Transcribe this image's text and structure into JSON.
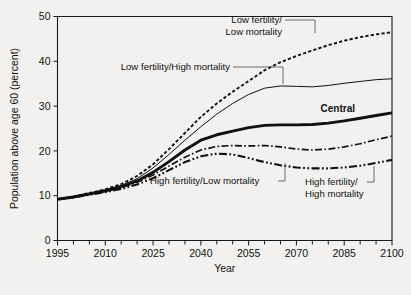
{
  "chart_data": {
    "type": "line",
    "title": "",
    "xlabel": "Year",
    "ylabel": "Population above age 60 (percent)",
    "xlim": [
      1995,
      2100
    ],
    "ylim": [
      0,
      50
    ],
    "xticks": [
      1995,
      2010,
      2025,
      2040,
      2055,
      2070,
      2085,
      2100
    ],
    "xtick_labels": [
      "1995",
      "2010",
      "2025",
      "2040",
      "2055",
      "2070",
      "2085",
      "2100"
    ],
    "xminor_step": 5,
    "yticks": [
      0,
      10,
      20,
      30,
      40,
      50
    ],
    "ytick_labels": [
      "0",
      "10",
      "20",
      "30",
      "40",
      "50"
    ],
    "grid": false,
    "legend": "inline-annotations",
    "x": [
      1995,
      2000,
      2005,
      2010,
      2015,
      2020,
      2025,
      2030,
      2035,
      2040,
      2045,
      2050,
      2055,
      2060,
      2065,
      2070,
      2075,
      2080,
      2085,
      2090,
      2095,
      2100
    ],
    "series": [
      {
        "name": "Low fertility/Low mortality",
        "style": "dotted",
        "width": 1.9,
        "values": [
          9.2,
          9.8,
          10.6,
          11.4,
          12.6,
          14.4,
          17.0,
          20.4,
          24.0,
          27.6,
          30.6,
          33.2,
          35.6,
          38.0,
          39.8,
          41.2,
          42.4,
          43.6,
          44.6,
          45.4,
          46.0,
          46.5
        ]
      },
      {
        "name": "Low fertility/High mortality",
        "style": "solid-thin",
        "width": 1.0,
        "values": [
          9.2,
          9.8,
          10.5,
          11.3,
          12.3,
          13.8,
          16.2,
          19.2,
          22.4,
          25.4,
          28.2,
          30.6,
          32.6,
          34.0,
          34.5,
          34.4,
          34.3,
          34.6,
          35.1,
          35.5,
          35.9,
          36.1
        ]
      },
      {
        "name": "Central",
        "style": "solid-thick",
        "width": 2.9,
        "values": [
          9.2,
          9.7,
          10.4,
          11.1,
          12.0,
          13.3,
          15.2,
          17.6,
          20.2,
          22.4,
          23.6,
          24.4,
          25.2,
          25.7,
          25.8,
          25.8,
          25.9,
          26.2,
          26.7,
          27.3,
          27.9,
          28.5
        ]
      },
      {
        "name": "High fertility/Low mortality",
        "style": "dash-dot",
        "width": 1.7,
        "values": [
          9.2,
          9.7,
          10.3,
          11.0,
          11.8,
          13.0,
          14.6,
          16.6,
          18.6,
          20.2,
          21.0,
          21.2,
          21.1,
          21.2,
          20.9,
          20.4,
          20.2,
          20.4,
          20.9,
          21.6,
          22.5,
          23.3
        ]
      },
      {
        "name": "High fertility/High mortality",
        "style": "dash-dot-dot",
        "width": 2.1,
        "values": [
          9.2,
          9.6,
          10.2,
          10.8,
          11.5,
          12.5,
          13.9,
          15.7,
          17.5,
          18.8,
          19.4,
          19.2,
          18.4,
          17.5,
          16.8,
          16.3,
          16.1,
          16.1,
          16.3,
          16.7,
          17.3,
          18.0
        ]
      }
    ],
    "annotations": [
      {
        "id": "low-low",
        "text_line1": "Low fertility/",
        "text_line2": "Low mortality"
      },
      {
        "id": "low-high",
        "text_line1": "Low fertility/High mortality",
        "text_line2": ""
      },
      {
        "id": "central",
        "text_line1": "Central",
        "text_line2": ""
      },
      {
        "id": "high-low",
        "text_line1": "High fertility/Low mortality",
        "text_line2": ""
      },
      {
        "id": "high-high",
        "text_line1": "High fertility/",
        "text_line2": "High mortality"
      }
    ],
    "colors": {
      "line": "#111111",
      "background": "#f2f1ef",
      "axis": "#1a1a1a"
    }
  }
}
